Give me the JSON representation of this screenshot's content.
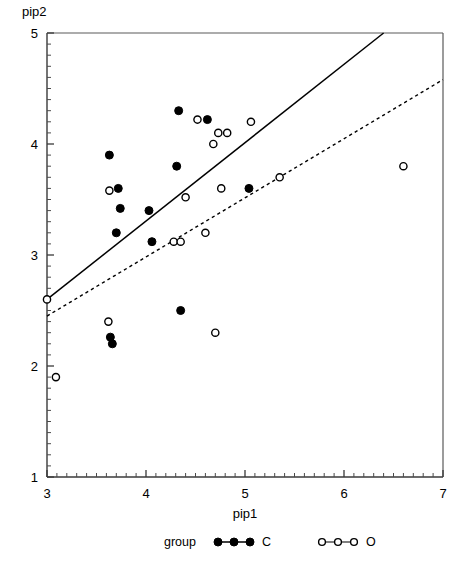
{
  "chart_data": {
    "type": "scatter",
    "title": "",
    "xlabel": "pip1",
    "ylabel": "pip2",
    "xlim": [
      3,
      7
    ],
    "ylim": [
      1,
      5
    ],
    "xticks": [
      3,
      4,
      5,
      6,
      7
    ],
    "yticks": [
      1,
      2,
      3,
      4,
      5
    ],
    "xtick_labels": [
      "3",
      "4",
      "5",
      "6",
      "7"
    ],
    "ytick_labels": [
      "1",
      "2",
      "3",
      "4",
      "5"
    ],
    "minor_ticks_per_interval": 10,
    "grid": false,
    "legend": {
      "position": "bottom",
      "title": "group",
      "entries": [
        {
          "name": "C",
          "label": "C",
          "marker": "filled-circle",
          "color": "#000000"
        },
        {
          "name": "O",
          "label": "O",
          "marker": "open-circle",
          "color": "#000000"
        }
      ]
    },
    "series": [
      {
        "name": "C",
        "marker": "filled-circle",
        "points": [
          {
            "x": 3.63,
            "y": 3.9
          },
          {
            "x": 3.72,
            "y": 3.6
          },
          {
            "x": 3.74,
            "y": 3.42
          },
          {
            "x": 3.7,
            "y": 3.2
          },
          {
            "x": 3.64,
            "y": 2.26
          },
          {
            "x": 3.66,
            "y": 2.2
          },
          {
            "x": 4.03,
            "y": 3.4
          },
          {
            "x": 4.06,
            "y": 3.12
          },
          {
            "x": 4.33,
            "y": 4.3
          },
          {
            "x": 4.31,
            "y": 3.8
          },
          {
            "x": 4.35,
            "y": 2.5
          },
          {
            "x": 4.62,
            "y": 4.22
          },
          {
            "x": 5.04,
            "y": 3.6
          }
        ]
      },
      {
        "name": "O",
        "marker": "open-circle",
        "points": [
          {
            "x": 3.0,
            "y": 2.6
          },
          {
            "x": 3.09,
            "y": 1.9
          },
          {
            "x": 3.63,
            "y": 3.58
          },
          {
            "x": 3.62,
            "y": 2.4
          },
          {
            "x": 4.28,
            "y": 3.12
          },
          {
            "x": 4.35,
            "y": 3.12
          },
          {
            "x": 4.4,
            "y": 3.52
          },
          {
            "x": 4.52,
            "y": 4.22
          },
          {
            "x": 4.6,
            "y": 3.2
          },
          {
            "x": 4.68,
            "y": 4.0
          },
          {
            "x": 4.73,
            "y": 4.1
          },
          {
            "x": 4.82,
            "y": 4.1
          },
          {
            "x": 4.76,
            "y": 3.6
          },
          {
            "x": 4.7,
            "y": 2.3
          },
          {
            "x": 5.06,
            "y": 4.2
          },
          {
            "x": 5.35,
            "y": 3.7
          },
          {
            "x": 6.6,
            "y": 3.8
          }
        ]
      }
    ],
    "fit_lines": [
      {
        "name": "solid-fit-line",
        "style": "solid",
        "x0": 3.0,
        "y0": 2.6,
        "x1": 6.4,
        "y1": 5.0
      },
      {
        "name": "dashed-fit-line",
        "style": "dashed",
        "x0": 3.0,
        "y0": 2.45,
        "x1": 7.0,
        "y1": 4.58
      }
    ]
  }
}
